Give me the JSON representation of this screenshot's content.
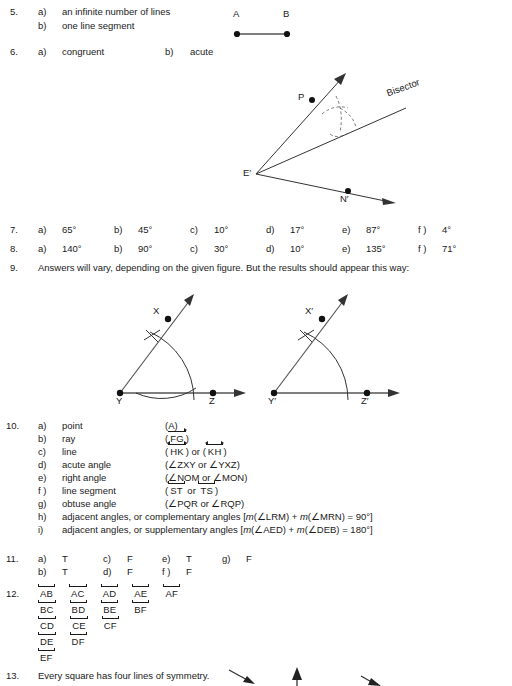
{
  "page": {
    "background": "#ffffff",
    "ink": "#1a1a1a"
  },
  "items": [
    {
      "number": "5.",
      "parts": [
        {
          "letter": "a)",
          "text": "an infinite number of lines"
        },
        {
          "letter": "b)",
          "text": "one line segment"
        }
      ]
    },
    {
      "number": "6.",
      "parts": [
        {
          "letter": "a)",
          "text": "congruent"
        },
        {
          "letter": "b)",
          "text": "acute"
        }
      ]
    },
    {
      "number": "7.",
      "parts": [
        {
          "letter": "a)",
          "text": "65°"
        },
        {
          "letter": "b)",
          "text": "45°"
        },
        {
          "letter": "c)",
          "text": "10°"
        },
        {
          "letter": "d)",
          "text": "17°"
        },
        {
          "letter": "e)",
          "text": "87°"
        },
        {
          "letter": "f )",
          "text": "4°"
        }
      ]
    },
    {
      "number": "8.",
      "parts": [
        {
          "letter": "a)",
          "text": "140°"
        },
        {
          "letter": "b)",
          "text": "90°"
        },
        {
          "letter": "c)",
          "text": "30°"
        },
        {
          "letter": "d)",
          "text": "10°"
        },
        {
          "letter": "e)",
          "text": "135°"
        },
        {
          "letter": "f )",
          "text": "71°"
        }
      ]
    },
    {
      "number": "9.",
      "text": "Answers will vary, depending on the given figure. But the results should appear this way:"
    },
    {
      "number": "10.",
      "parts": [
        {
          "letter": "a)",
          "term": "point",
          "notation_plain": "(A)"
        },
        {
          "letter": "b)",
          "term": "ray",
          "notation_plain": "(FG)"
        },
        {
          "letter": "c)",
          "term": "line",
          "notation_plain": "(HK) or (KH)"
        },
        {
          "letter": "d)",
          "term": "acute angle",
          "notation_plain": "(∠ZXY or ∠YXZ)"
        },
        {
          "letter": "e)",
          "term": "right angle",
          "notation_plain": "(∠NOM or ∠MON)"
        },
        {
          "letter": "f )",
          "term": "line segment",
          "notation_plain": "(ST or TS)"
        },
        {
          "letter": "g)",
          "term": "obtuse angle",
          "notation_plain": "(∠PQR or ∠RQP)"
        },
        {
          "letter": "h)",
          "term": "adjacent angles, or complementary angles [m(∠LRM) + m(∠MRN) = 90°]"
        },
        {
          "letter": "i)",
          "term": "adjacent angles, or supplementary angles [m(∠AED) + m(∠DEB) = 180°]"
        }
      ]
    },
    {
      "number": "11.",
      "parts": [
        {
          "letter": "a)",
          "text": "T"
        },
        {
          "letter": "b)",
          "text": "T"
        },
        {
          "letter": "c)",
          "text": "F"
        },
        {
          "letter": "d)",
          "text": "F"
        },
        {
          "letter": "e)",
          "text": "T"
        },
        {
          "letter": "f )",
          "text": "F"
        },
        {
          "letter": "g)",
          "text": "F"
        }
      ]
    },
    {
      "number": "12.",
      "rows": [
        [
          "AB",
          "AC",
          "AD",
          "AE",
          "AF"
        ],
        [
          "BC",
          "BD",
          "BE",
          "BF"
        ],
        [
          "CD",
          "CE",
          "CF"
        ],
        [
          "DE",
          "DF"
        ],
        [
          "EF"
        ]
      ]
    },
    {
      "number": "13.",
      "text": "Every square has four lines of symmetry."
    }
  ],
  "notation_10": {
    "a": {
      "open": "(",
      "name": "A",
      "close": ")"
    },
    "b": {
      "open": "(",
      "name": "FG",
      "close": ")",
      "kind": "ray"
    },
    "c": {
      "open": "(",
      "first": "HK",
      "mid": ") or (",
      "second": "KH",
      "close": ")",
      "kind": "line"
    },
    "d": "(∠ZXY or ∠YXZ)",
    "e": "(∠NOM or ∠MON)",
    "f": {
      "open": "(",
      "first": "ST",
      "mid": " or ",
      "second": "TS",
      "close": ")",
      "kind": "segment"
    },
    "g": "(∠PQR or ∠RQP)",
    "h_pre": "adjacent angles, or complementary angles [",
    "h_m1": "m",
    "h_a1": "(∠LRM) + ",
    "h_m2": "m",
    "h_a2": "(∠MRN) = 90°]",
    "i_pre": "adjacent angles, or supplementary angles [",
    "i_m1": "m",
    "i_a1": "(∠AED) + ",
    "i_m2": "m",
    "i_a2": "(∠DEB) = 180°]"
  },
  "figures": {
    "segment_ab": {
      "label_a": "A",
      "label_b": "B"
    },
    "bisector": {
      "label_p": "P",
      "label_e": "E′",
      "label_n": "N′",
      "label_bisector": "Bisector"
    },
    "angle_xyz": {
      "label_x": "X",
      "label_y": "Y",
      "label_z": "Z"
    },
    "angle_xyz_prime": {
      "label_x": "X′",
      "label_y": "Y′",
      "label_z": "Z′"
    }
  }
}
